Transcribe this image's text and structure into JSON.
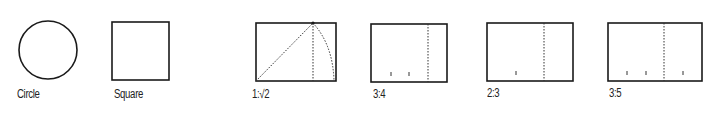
{
  "figure": {
    "shapes": [
      {
        "id": "circle",
        "label": "Circle"
      },
      {
        "id": "square",
        "label": "Square"
      },
      {
        "id": "ratio-1-sqrt2",
        "label": "1:√2"
      },
      {
        "id": "ratio-3-4",
        "label": "3:4"
      },
      {
        "id": "ratio-2-3",
        "label": "2:3"
      },
      {
        "id": "ratio-3-5",
        "label": "3:5"
      }
    ],
    "colors": {
      "stroke": "#1a1a1a",
      "background": "#ffffff"
    }
  }
}
